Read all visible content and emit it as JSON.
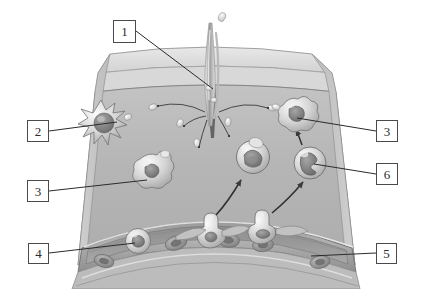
{
  "figure": {
    "background_color": "#ffffff",
    "tissue_color": "#b6b6b6",
    "tissue_top_color": "#dedede",
    "tissue_side_color": "#c9c9c9",
    "vessel_color": "#a9a9a9",
    "outline_color": "#6e6e6e",
    "leader_color": "#2b2b2b",
    "label_border_color": "#4a4a4a",
    "label_text_color": "#2b2b2b"
  },
  "callouts": [
    {
      "id": "1",
      "label": "1",
      "target": "splinter-wound",
      "box": {
        "x": 113,
        "y": 20,
        "w": 23,
        "h": 23
      },
      "leader": {
        "x1": 136,
        "y1": 31,
        "x2": 213,
        "y2": 89
      }
    },
    {
      "id": "2",
      "label": "2",
      "target": "dendritic-mast-cell",
      "box": {
        "x": 27,
        "y": 120,
        "w": 22,
        "h": 22
      },
      "leader": {
        "x1": 49,
        "y1": 131,
        "x2": 117,
        "y2": 122
      }
    },
    {
      "id": "3l",
      "label": "3",
      "target": "macrophage-left",
      "box": {
        "x": 27,
        "y": 180,
        "w": 22,
        "h": 22
      },
      "leader": {
        "x1": 49,
        "y1": 191,
        "x2": 145,
        "y2": 180
      }
    },
    {
      "id": "4",
      "label": "4",
      "target": "leukocyte-in-vessel",
      "box": {
        "x": 28,
        "y": 243,
        "w": 21,
        "h": 21
      },
      "leader": {
        "x1": 49,
        "y1": 253,
        "x2": 133,
        "y2": 243
      }
    },
    {
      "id": "3r",
      "label": "3",
      "target": "macrophage-right",
      "box": {
        "x": 376,
        "y": 120,
        "w": 22,
        "h": 22
      },
      "leader": {
        "x1": 376,
        "y1": 131,
        "x2": 297,
        "y2": 118
      }
    },
    {
      "id": "6",
      "label": "6",
      "target": "neutrophil",
      "box": {
        "x": 376,
        "y": 163,
        "w": 22,
        "h": 22
      },
      "leader": {
        "x1": 376,
        "y1": 174,
        "x2": 313,
        "y2": 163
      }
    },
    {
      "id": "5",
      "label": "5",
      "target": "blood-vessel",
      "box": {
        "x": 376,
        "y": 243,
        "w": 21,
        "h": 21
      },
      "leader": {
        "x1": 376,
        "y1": 253,
        "x2": 311,
        "y2": 256
      }
    }
  ],
  "structures": {
    "splinter": {
      "name": "splinter-wound",
      "x": 213,
      "y": 90
    },
    "dendritic_cell": {
      "name": "dendritic-mast-cell",
      "cx": 103,
      "cy": 122,
      "r": 16
    },
    "macrophage_left": {
      "name": "macrophage-left",
      "cx": 152,
      "cy": 172,
      "r": 17
    },
    "macrophage_right": {
      "name": "macrophage-right",
      "cx": 297,
      "cy": 115,
      "r": 18
    },
    "monocyte": {
      "name": "monocyte",
      "cx": 253,
      "cy": 157,
      "r": 16
    },
    "neutrophil": {
      "name": "neutrophil",
      "cx": 310,
      "cy": 163,
      "r": 16
    },
    "leukocyte_in_vessel": {
      "name": "leukocyte-in-vessel",
      "cx": 138,
      "cy": 241,
      "r": 12
    },
    "blood_vessel": {
      "name": "blood-vessel"
    },
    "bacteria_count": 7,
    "red_blood_cell_count": 5
  }
}
